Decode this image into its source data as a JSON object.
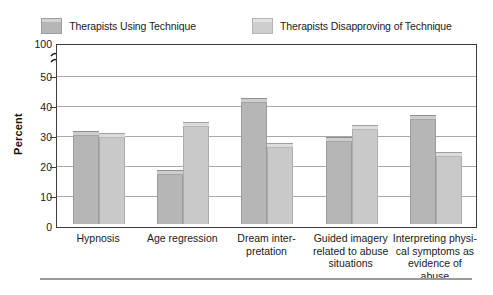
{
  "legend": {
    "position": "top",
    "entries": [
      {
        "label": "Therapists Using Technique",
        "color": "#b6b6b6",
        "swatch_icon": "legend-swatch-icon"
      },
      {
        "label": "Therapists Disapproving of Technique",
        "color": "#c9c9c9",
        "swatch_icon": "legend-swatch-icon"
      }
    ]
  },
  "axis": {
    "y_title": "Percent",
    "y_ticks": [
      "0",
      "10",
      "20",
      "30",
      "40",
      "50",
      "100"
    ],
    "break_symbol": "axis-break-icon"
  },
  "chart_data": {
    "type": "bar",
    "title": "",
    "xlabel": "",
    "ylabel": "Percent",
    "ylim": [
      0,
      50
    ],
    "y_axis_break": true,
    "y_axis_break_note": "Axis broken between 50 and 100",
    "y_ticks": [
      0,
      10,
      20,
      30,
      40,
      50,
      100
    ],
    "grid": true,
    "legend_position": "top",
    "categories": [
      "Hypnosis",
      "Age regression",
      "Dream inter-\npretation",
      "Guided imagery\nrelated to abuse\nsituations",
      "Interpreting physi-\ncal symptoms as\nevidence of abuse"
    ],
    "category_lines": [
      [
        "Hypnosis"
      ],
      [
        "Age regression"
      ],
      [
        "Dream inter-",
        "pretation"
      ],
      [
        "Guided imagery",
        "related to abuse",
        "situations"
      ],
      [
        "Interpreting physi-",
        "cal symptoms as",
        "evidence of abuse"
      ]
    ],
    "series": [
      {
        "name": "Therapists Using Technique",
        "color": "#b6b6b6",
        "values": [
          31,
          18,
          42,
          29,
          36.5
        ]
      },
      {
        "name": "Therapists Disapproving of Technique",
        "color": "#c9c9c9",
        "values": [
          30.3,
          34,
          27,
          33,
          24
        ]
      }
    ]
  }
}
